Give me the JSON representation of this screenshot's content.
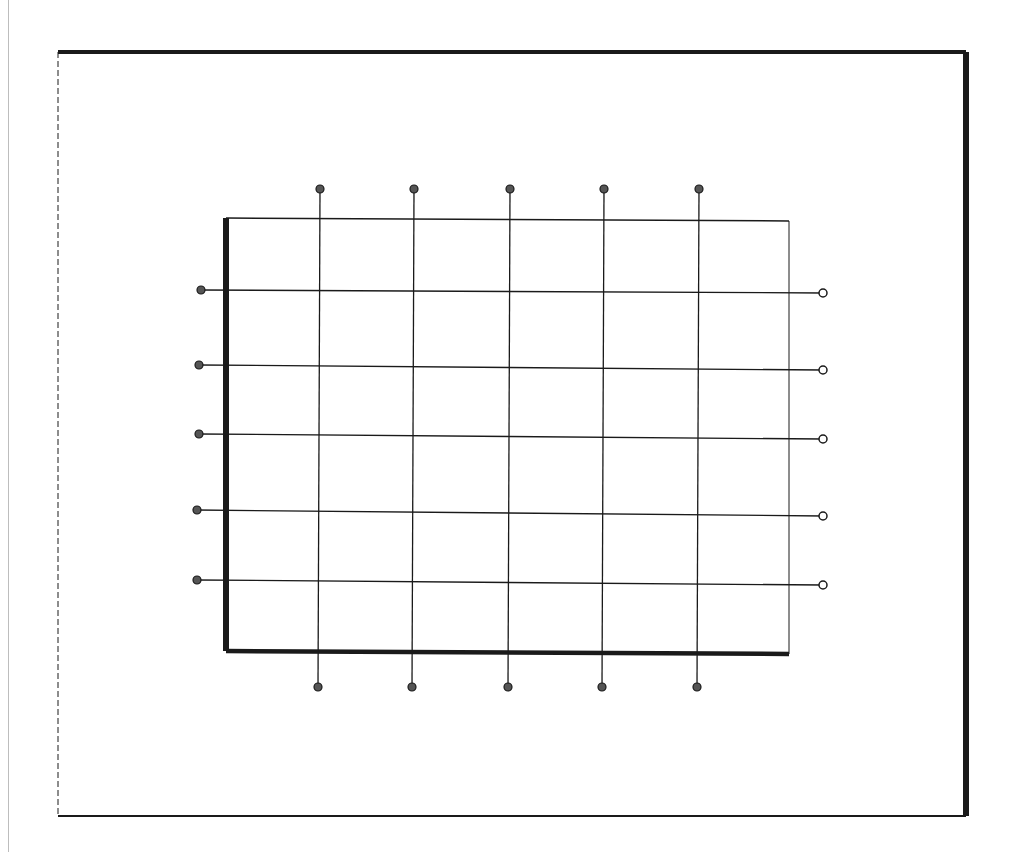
{
  "diagram": {
    "type": "grid-with-terminals",
    "colors": {
      "ink": "#1a1a1a",
      "background": "#ffffff",
      "margin_rule": "#bdbdbd"
    },
    "outer_frame": {
      "x1": 58,
      "y1": 52,
      "x2": 966,
      "y2": 816
    },
    "inner_frame": {
      "x1": 226,
      "y1": 218,
      "x2": 789,
      "y2": 654
    },
    "vertical_lines": [
      {
        "x": 318,
        "top_terminal_y": 189,
        "bottom_terminal_y": 687
      },
      {
        "x": 412,
        "top_terminal_y": 189,
        "bottom_terminal_y": 687
      },
      {
        "x": 508,
        "top_terminal_y": 189,
        "bottom_terminal_y": 687
      },
      {
        "x": 602,
        "top_terminal_y": 189,
        "bottom_terminal_y": 687
      },
      {
        "x": 697,
        "top_terminal_y": 189,
        "bottom_terminal_y": 687
      }
    ],
    "horizontal_lines": [
      {
        "y_left": 290,
        "y_right": 293,
        "left_terminal_x": 201,
        "right_terminal_x": 823
      },
      {
        "y_left": 365,
        "y_right": 370,
        "left_terminal_x": 199,
        "right_terminal_x": 823
      },
      {
        "y_left": 434,
        "y_right": 439,
        "left_terminal_x": 199,
        "right_terminal_x": 823
      },
      {
        "y_left": 510,
        "y_right": 516,
        "left_terminal_x": 197,
        "right_terminal_x": 823
      },
      {
        "y_left": 580,
        "y_right": 585,
        "left_terminal_x": 197,
        "right_terminal_x": 823
      }
    ],
    "terminal_radius": 4
  }
}
